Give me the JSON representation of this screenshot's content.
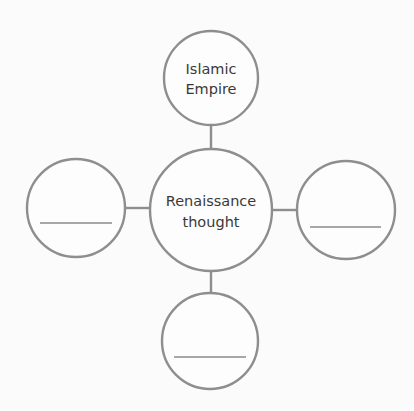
{
  "diagram": {
    "type": "concept-web",
    "center": {
      "line1": "Renaissance",
      "line2": "thought"
    },
    "nodes": {
      "top": {
        "line1": "Islamic",
        "line2": "Empire"
      },
      "left": {
        "blank": true
      },
      "right": {
        "blank": true
      },
      "bottom": {
        "blank": true
      }
    },
    "colors": {
      "stroke": "#8e8e8e",
      "text": "#3a3a3a",
      "background": "#fbfbfb"
    }
  }
}
